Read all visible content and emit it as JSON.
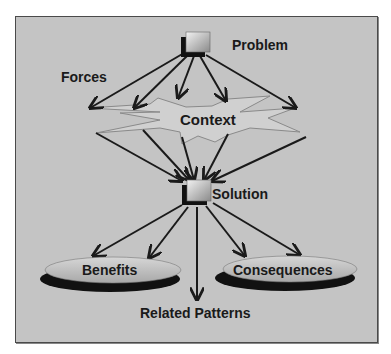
{
  "diagram": {
    "nodes": {
      "problem": "Problem",
      "forces": "Forces",
      "context": "Context",
      "solution": "Solution",
      "benefits": "Benefits",
      "consequences": "Consequences",
      "related_patterns": "Related Patterns"
    },
    "edges": [
      {
        "from": "problem",
        "to": "context"
      },
      {
        "from": "context",
        "to": "solution"
      },
      {
        "from": "solution",
        "to": "benefits"
      },
      {
        "from": "solution",
        "to": "consequences"
      },
      {
        "from": "solution",
        "to": "related_patterns"
      }
    ],
    "colors": {
      "background": "#c4c4c4",
      "arrow": "#1a1a1a",
      "ellipse_fill": "#bdbdbd",
      "ellipse_shadow": "#111111",
      "box_shadow": "#111111"
    }
  }
}
